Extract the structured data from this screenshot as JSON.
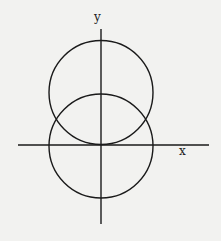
{
  "diagram": {
    "axes": {
      "x_label": "x",
      "y_label": "y"
    },
    "shapes": [
      {
        "name": "upper-circle",
        "type": "circle",
        "note": "tangent to x-axis at origin"
      },
      {
        "name": "lower-circle",
        "type": "circle",
        "note": "centered at origin"
      }
    ],
    "colors": {
      "background": "#f2f2f0",
      "stroke": "#1a1a1a"
    }
  }
}
